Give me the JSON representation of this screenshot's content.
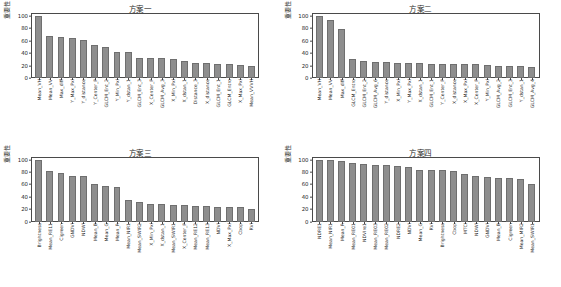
{
  "figure": {
    "ylabel": "重要性",
    "axis": {
      "ymin": 0,
      "ymax": 105,
      "yticks": [
        0,
        20,
        40,
        60,
        80,
        100
      ]
    },
    "bar_color": "#8e8e8e"
  },
  "chart_data": [
    {
      "type": "bar",
      "title": "方案一",
      "xlabel": "",
      "ylabel": "重要性",
      "ylim": [
        0,
        105
      ],
      "yticks": [
        0,
        20,
        40,
        60,
        80,
        100
      ],
      "grid": false,
      "legend": "none",
      "categories": [
        "Mean_VH",
        "Mean_VV",
        "Max_diff",
        "Y_Max_Pxl",
        "Y_distance",
        "Y_Center_P",
        "GLCM_Ent_2",
        "Y_Min_Pxl",
        "Y_dstan_1",
        "GLCM_Ent_3",
        "X_Center_P",
        "GLCM_Avg_3",
        "X_Min_Pxl",
        "X_dstan_1",
        "Distance_3",
        "X_distance",
        "GLCM_Ent_1",
        "GLCM_Entro",
        "X_Max_Pxl",
        "Mean_VVVH"
      ],
      "values": [
        100,
        68,
        67,
        64,
        61,
        54,
        50,
        42,
        42,
        33,
        32,
        32,
        30,
        28,
        25,
        24,
        23,
        22,
        21,
        20
      ]
    },
    {
      "type": "bar",
      "title": "方案二",
      "xlabel": "",
      "ylabel": "重要性",
      "ylim": [
        0,
        105
      ],
      "yticks": [
        0,
        20,
        40,
        60,
        80,
        100
      ],
      "grid": false,
      "legend": "none",
      "categories": [
        "Mean_VH",
        "Mean_VV",
        "Max_diff",
        "GLCM_Entro",
        "GLCM_Ent_2",
        "GLCM_Avg_6",
        "Y_distance",
        "X_Min_Pxl",
        "Y_Max_Pxl",
        "X_dstan_1",
        "GLCM_Ent_1",
        "Y_Center_P",
        "X_distance",
        "X_Max_Pxl",
        "X_Center_P",
        "Y_Min_Pxl",
        "GLCM_Avg_2",
        "GLCM_Ent_3",
        "Y_dstan_1",
        "GLCM_Avg_4"
      ],
      "values": [
        100,
        93,
        79,
        30,
        28,
        26,
        26,
        25,
        24,
        24,
        23,
        23,
        23,
        22,
        22,
        21,
        20,
        20,
        19,
        18
      ]
    },
    {
      "type": "bar",
      "title": "方案三",
      "xlabel": "",
      "ylabel": "重要性",
      "ylim": [
        0,
        105
      ],
      "yticks": [
        0,
        20,
        40,
        60,
        80,
        100
      ],
      "grid": false,
      "legend": "none",
      "categories": [
        "Brightness",
        "Mean_RE11",
        "Cigreen",
        "GNDVI",
        "NDWI",
        "Mean_B",
        "Mean_G",
        "Mean_R",
        "Mean_NIR1",
        "Mean_SWIR2",
        "X_Min_Pxl",
        "X_dstan_1",
        "Mean_SWIR1",
        "X_Center_P",
        "Mean_RE12",
        "Mean_RE13",
        "NDVI",
        "X_Max_Pxl",
        "Cbop",
        "RVI"
      ],
      "values": [
        100,
        82,
        78,
        74,
        73,
        61,
        58,
        55,
        34,
        32,
        29,
        28,
        27,
        27,
        25,
        25,
        24,
        23,
        23,
        21
      ]
    },
    {
      "type": "bar",
      "title": "方案四",
      "xlabel": "",
      "ylabel": "重要性",
      "ylim": [
        0,
        105
      ],
      "yticks": [
        0,
        20,
        40,
        60,
        80,
        100
      ],
      "grid": false,
      "legend": "none",
      "categories": [
        "NDRE1",
        "Mean_NIR1",
        "Mean_R",
        "Mean_RE01",
        "NDVIre1",
        "Mean_RE03",
        "Mean_RE02",
        "NDRE2",
        "NDVI",
        "Mean_G",
        "RVI",
        "Brightness",
        "Cbop",
        "MTCI",
        "NDWI",
        "GNDVI",
        "Mean_B",
        "Cigreen",
        "Mean_MIR2",
        "Mean_SWIR1"
      ],
      "values": [
        100,
        100,
        98,
        94,
        93,
        91,
        91,
        90,
        88,
        84,
        84,
        83,
        81,
        77,
        74,
        72,
        70,
        70,
        69,
        60
      ]
    }
  ]
}
